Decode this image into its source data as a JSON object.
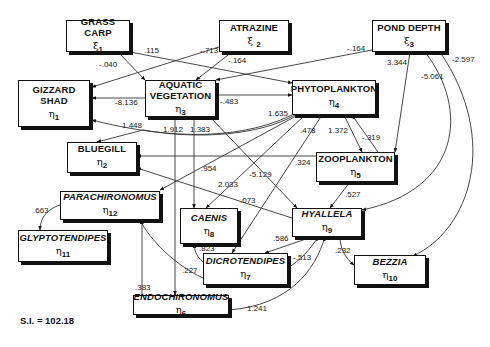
{
  "diagram": {
    "type": "path-diagram",
    "fit_index": "S.I. = 102.18",
    "nodes": {
      "grass_carp": {
        "name": "GRASS CARP",
        "symbol": "ξ",
        "index": "1"
      },
      "atrazine": {
        "name": "ATRAZINE",
        "symbol": "ξ",
        "index": "2"
      },
      "pond_depth": {
        "name": "POND DEPTH",
        "symbol": "ξ",
        "index": "3"
      },
      "gizzard_shad": {
        "name_line1": "GIZZARD",
        "name_line2": "SHAD",
        "symbol": "η",
        "index": "1"
      },
      "aquatic_vegetation": {
        "name_line1": "AQUATIC",
        "name_line2": "VEGETATION",
        "symbol": "η",
        "index": "3"
      },
      "phytoplankton": {
        "name": "PHYTOPLANKTON",
        "symbol": "η",
        "index": "4"
      },
      "bluegill": {
        "name": "BLUEGILL",
        "symbol": "η",
        "index": "2"
      },
      "zooplankton": {
        "name": "ZOOPLANKTON",
        "symbol": "η",
        "index": "5"
      },
      "parachironomus": {
        "name": "PARACHIRONOMUS",
        "symbol": "η",
        "index": "12"
      },
      "caenis": {
        "name": "CAENIS",
        "symbol": "η",
        "index": "8"
      },
      "hyallela": {
        "name": "HYALLELA",
        "symbol": "η",
        "index": "9"
      },
      "glyptotendipes": {
        "name": "GLYPTOTENDIPES",
        "symbol": "η",
        "index": "11"
      },
      "dicrotendipes": {
        "name": "DICROTENDIPES",
        "symbol": "η",
        "index": "7"
      },
      "bezzia": {
        "name": "BEZZIA",
        "symbol": "η",
        "index": "10"
      },
      "endochironomus": {
        "name": "ENDOCHIRONOMUS",
        "symbol": "η",
        "index": "6"
      }
    },
    "edges": [
      {
        "from": "GRASS CARP",
        "to": "AQUATIC VEGETATION",
        "coef": "-.040"
      },
      {
        "from": "GRASS CARP",
        "to": "PHYTOPLANKTON",
        "coef": ".115"
      },
      {
        "from": "ATRAZINE",
        "to": "GIZZARD SHAD",
        "coef": "-.713"
      },
      {
        "from": "ATRAZINE",
        "to": "AQUATIC VEGETATION",
        "coef": "-.164"
      },
      {
        "from": "POND DEPTH",
        "to": "AQUATIC VEGETATION",
        "coef": "-.164"
      },
      {
        "from": "POND DEPTH",
        "to": "ZOOPLANKTON",
        "coef": "3.344"
      },
      {
        "from": "POND DEPTH",
        "to": "HYALLELA",
        "coef": "-5.061"
      },
      {
        "from": "POND DEPTH",
        "to": "BEZZIA",
        "coef": "-2.597"
      },
      {
        "from": "AQUATIC VEGETATION",
        "to": "GIZZARD SHAD",
        "coef": "-8.136"
      },
      {
        "from": "AQUATIC VEGETATION",
        "to": "PHYTOPLANKTON",
        "coef": "-.483"
      },
      {
        "from": "AQUATIC VEGETATION",
        "to": "ENDOCHIRONOMUS",
        "coef": "1.912"
      },
      {
        "from": "AQUATIC VEGETATION",
        "to": "CAENIS",
        "coef": "1.383"
      },
      {
        "from": "AQUATIC VEGETATION",
        "to": "HYALLELA",
        "coef": "-5.129"
      },
      {
        "from": "PHYTOPLANKTON",
        "to": "GIZZARD SHAD",
        "coef": "1.635"
      },
      {
        "from": "PHYTOPLANKTON",
        "to": "BLUEGILL",
        "coef": "1.448"
      },
      {
        "from": "PHYTOPLANKTON",
        "to": "PARACHIRONOMUS",
        "coef": ".954"
      },
      {
        "from": "PHYTOPLANKTON",
        "to": "CAENIS",
        "coef": "2.033"
      },
      {
        "from": "PHYTOPLANKTON",
        "to": "DICROTENDIPES",
        "coef": ".478"
      },
      {
        "from": "PHYTOPLANKTON",
        "to": "ZOOPLANKTON",
        "coef": "1.372"
      },
      {
        "from": "ZOOPLANKTON",
        "to": "PHYTOPLANKTON",
        "coef": "-.319"
      },
      {
        "from": "ZOOPLANKTON",
        "to": "BLUEGILL",
        "coef": ".324"
      },
      {
        "from": "ZOOPLANKTON",
        "to": "HYALLELA",
        "coef": ".527"
      },
      {
        "from": "HYALLELA",
        "to": "BLUEGILL",
        "coef": ".073"
      },
      {
        "from": "HYALLELA",
        "to": "DICROTENDIPES",
        "coef": ".586"
      },
      {
        "from": "HYALLELA",
        "to": "BEZZIA",
        "coef": ".232"
      },
      {
        "from": "DICROTENDIPES",
        "to": "HYALLELA",
        "coef": "-.513"
      },
      {
        "from": "DICROTENDIPES",
        "to": "CAENIS",
        "coef": ".823"
      },
      {
        "from": "DICROTENDIPES",
        "to": "PARACHIRONOMUS",
        "coef": ".227"
      },
      {
        "from": "ENDOCHIRONOMUS",
        "to": "PARACHIRONOMUS",
        "coef": ".383"
      },
      {
        "from": "ENDOCHIRONOMUS",
        "to": "HYALLELA",
        "coef": "1.241"
      },
      {
        "from": "PARACHIRONOMUS",
        "to": "GLYPTOTENDIPES",
        "coef": ".663"
      }
    ],
    "labels": {
      "e_gc_av": "-.040",
      "e_gc_ph": ".115",
      "e_at_gs": "-.713",
      "e_at_av": "-.164",
      "e_pd_av": "-.164",
      "e_pd_zo": "3.344",
      "e_pd_hy": "-5.061",
      "e_pd_bz": "-2.597",
      "e_av_gs": "-8.136",
      "e_av_ph": "-.483",
      "e_av_en": "1.912",
      "e_av_ca": "1.383",
      "e_av_hy": "-5.129",
      "e_ph_gs": "1.635",
      "e_ph_bg": "1.448",
      "e_ph_pa": ".954",
      "e_ph_ca": "2.033",
      "e_ph_di": ".478",
      "e_ph_zo": "1.372",
      "e_zo_ph": "-.319",
      "e_zo_bg": ".324",
      "e_zo_hy": ".527",
      "e_hy_bg": ".073",
      "e_hy_di": ".586",
      "e_hy_bz": ".232",
      "e_di_hy": "-.513",
      "e_di_ca": ".823",
      "e_di_pa": ".227",
      "e_en_pa": ".383",
      "e_en_hy": "1.241",
      "e_pa_gl": ".663"
    }
  }
}
